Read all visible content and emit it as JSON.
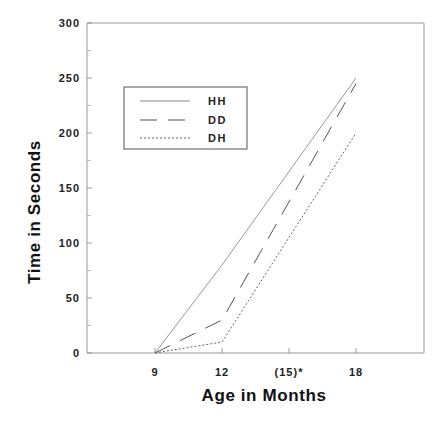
{
  "chart_data": {
    "type": "line",
    "title": "",
    "xlabel": "Age in Months",
    "ylabel": "Time in Seconds",
    "x": [
      9,
      12,
      18
    ],
    "x_tick_positions": [
      9,
      12,
      15,
      18
    ],
    "x_tick_labels": [
      "9",
      "12",
      "(15)*",
      "18"
    ],
    "xlim": [
      6,
      21
    ],
    "ylim": [
      0,
      300
    ],
    "y_ticks": [
      0,
      50,
      100,
      150,
      200,
      250,
      300
    ],
    "y_tick_labels": [
      "0",
      "50",
      "100",
      "150",
      "200",
      "250",
      "300"
    ],
    "grid": false,
    "legend_position": "upper left (inside)",
    "series": [
      {
        "name": "HH",
        "style": "solid",
        "values": [
          0,
          80,
          250
        ]
      },
      {
        "name": "DD",
        "style": "long-dash",
        "values": [
          0,
          30,
          245
        ]
      },
      {
        "name": "DH",
        "style": "dotted",
        "values": [
          0,
          10,
          200
        ]
      }
    ]
  },
  "legend": {
    "items": [
      {
        "label": "HH"
      },
      {
        "label": "DD"
      },
      {
        "label": "DH"
      }
    ]
  }
}
